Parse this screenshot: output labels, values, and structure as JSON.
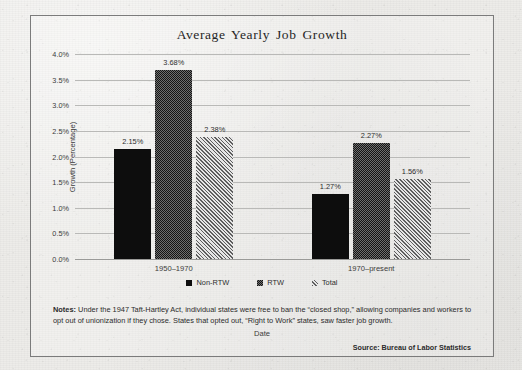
{
  "figure": {
    "title": "Average Yearly Job Growth",
    "notes_label": "Notes:",
    "notes_body": " Under the 1947 Taft-Hartley Act, individual states were free to ban the “closed shop,” allowing companies and workers to opt out of unionization if they chose. States that opted out, “Right to Work” states, saw faster job growth.",
    "source": "Source: Bureau of Labor Statistics",
    "frame_color": "#7b7b7b",
    "paper_color": "#edece9"
  },
  "chart_data": {
    "type": "bar",
    "title": "Average Yearly Job Growth",
    "xlabel": "Date",
    "ylabel": "Growth (Percentage)",
    "categories": [
      "1950–1970",
      "1970–present"
    ],
    "series": [
      {
        "name": "Non-RTW",
        "values": [
          2.15,
          1.27
        ],
        "labels": [
          "2.15%",
          "1.27%"
        ],
        "pattern": "solid",
        "color": "#0d0d0d"
      },
      {
        "name": "RTW",
        "values": [
          3.68,
          2.27
        ],
        "labels": [
          "3.68%",
          "2.27%"
        ],
        "pattern": "dotted",
        "color": "#3a3a3a"
      },
      {
        "name": "Total",
        "values": [
          2.38,
          1.56
        ],
        "labels": [
          "2.38%",
          "1.56%"
        ],
        "pattern": "diagonal-hatch",
        "color": "#d8d8d8"
      }
    ],
    "ylim": [
      0,
      4.0
    ],
    "ytick_step": 0.5,
    "yticks": [
      "0.0%",
      "0.5%",
      "1.0%",
      "1.5%",
      "2.0%",
      "2.5%",
      "3.0%",
      "3.5%",
      "4.0%"
    ],
    "grid": true,
    "legend_position": "bottom"
  },
  "legend": [
    {
      "label": "Non-RTW"
    },
    {
      "label": "RTW"
    },
    {
      "label": "Total"
    }
  ]
}
